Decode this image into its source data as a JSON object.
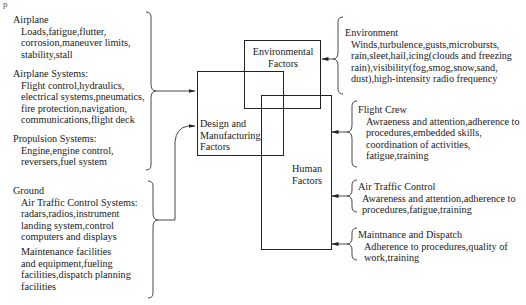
{
  "corner_mark": "p",
  "left": {
    "airplane": {
      "title": "Airplane",
      "lines": [
        "Loads,fatigue,flutter,",
        "corrosion,maneuver limits,",
        "stability,stall"
      ]
    },
    "airplane_systems": {
      "title": "Airplane Systems:",
      "lines": [
        "Flight control,hydraulics,",
        "electrical systems,pneumatics,",
        "fire protection,navigation,",
        "communications,flight deck"
      ]
    },
    "propulsion_systems": {
      "title": "Propulsion Systems:",
      "lines": [
        "Engine,engine control,",
        "reversers,fuel system"
      ]
    },
    "ground": {
      "title": "Ground",
      "atc_systems": {
        "title": "Air Traffic Control Systems:",
        "lines": [
          "radars,radios,instrument",
          "landing system,control",
          "computers and displays"
        ]
      },
      "maintenance": {
        "lines": [
          "Maintenance facilities",
          "and equipment,fueling",
          "facilities,dispatch planning",
          "facilities"
        ]
      }
    }
  },
  "boxes": {
    "environmental": {
      "lines": [
        "Environmental",
        "Factors"
      ]
    },
    "design": {
      "lines": [
        "Design and",
        "Manufacturing",
        "Factors"
      ]
    },
    "human": {
      "lines": [
        "Human",
        "Factors"
      ]
    }
  },
  "right": {
    "environment": {
      "title": "Environment",
      "lines": [
        "Winds,turbulence,gusts,microbursts,",
        "rain,sleet,hail,icing(clouds and freezing",
        "rain),visibility(fog,smog,snow,sand,",
        "dust),high-intensity radio frequency"
      ]
    },
    "flight_crew": {
      "title": "Flight Crew",
      "lines": [
        "Awraeness and attention,adherence to",
        "procedures,embedded skills,",
        "coordination of activities,",
        "fatigue,training"
      ]
    },
    "air_traffic_control": {
      "title": "Air Traffic Control",
      "lines": [
        "Awareness and attention,adherence to",
        "procedures,fatigue,training"
      ]
    },
    "maintenance_dispatch": {
      "title": "Maintnance and Dispatch",
      "lines": [
        "Adherence to procedures,quality of",
        "work,training"
      ]
    }
  }
}
